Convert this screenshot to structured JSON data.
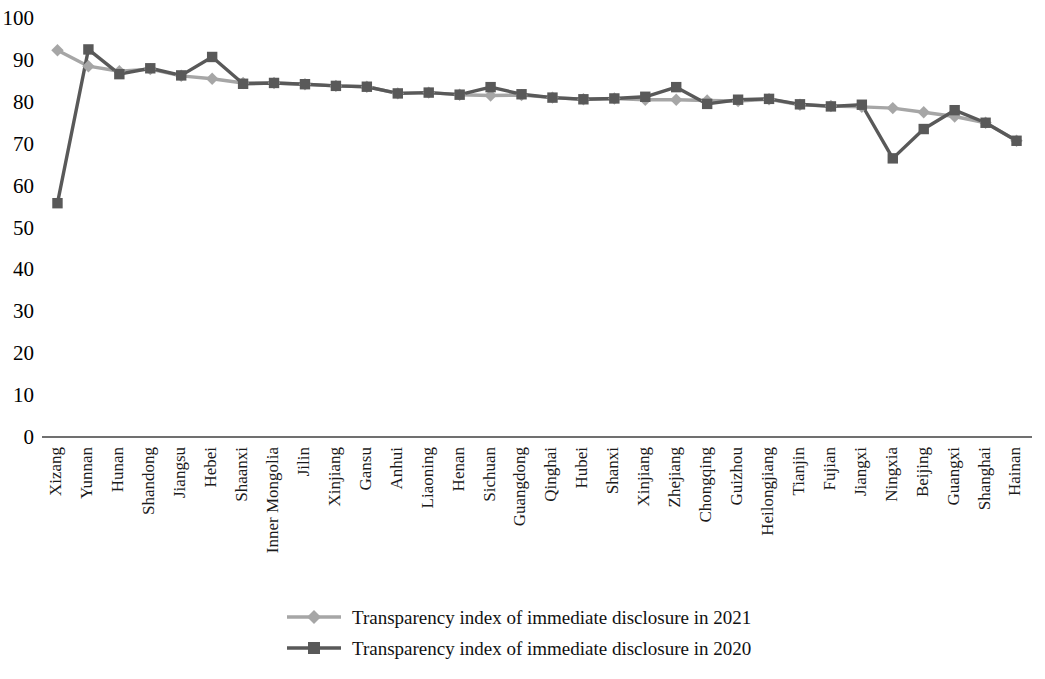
{
  "chart_data": {
    "type": "line",
    "title": "",
    "subtitle": "",
    "xlabel": "",
    "ylabel": "",
    "ylim": [
      0,
      100
    ],
    "ytick_values": [
      0,
      10,
      20,
      30,
      40,
      50,
      60,
      70,
      80,
      90,
      100
    ],
    "ytick_labels": [
      "0",
      "10",
      "20",
      "30",
      "40",
      "50",
      "60",
      "70",
      "80",
      "90",
      "100"
    ],
    "grid": false,
    "legend_position": "bottom",
    "categories": [
      "Xizang",
      "Yunnan",
      "Hunan",
      "Shandong",
      "Jiangsu",
      "Hebei",
      "Shaanxi",
      "Inner Mongolia",
      "Jilin",
      "Xinjiang",
      "Gansu",
      "Anhui",
      "Liaoning",
      "Henan",
      "Sichuan",
      "Guangdong",
      "Qinghai",
      "Hubei",
      "Shanxi",
      "Xinjiang",
      "Zhejiang",
      "Chongqing",
      "Guizhou",
      "Heilongjiang",
      "Tianjin",
      "Fujian",
      "Jiangxi",
      "Ningxia",
      "Beijing",
      "Guangxi",
      "Shanghai",
      "Hainan"
    ],
    "series": [
      {
        "name": "Transparency index of immediate disclosure in 2021",
        "color": "#a6a6a6",
        "marker": "diamond",
        "values": [
          92.3,
          88.5,
          87.3,
          87.8,
          86.2,
          85.5,
          84.5,
          84.5,
          84.2,
          83.8,
          83.6,
          82.0,
          82.2,
          81.7,
          81.5,
          81.6,
          81.0,
          80.6,
          80.8,
          80.5,
          80.5,
          80.3,
          80.2,
          80.6,
          79.3,
          79.0,
          78.8,
          78.5,
          77.5,
          76.5,
          75.0,
          70.7
        ]
      },
      {
        "name": "Transparency index of immediate disclosure in 2020",
        "color": "#595959",
        "marker": "square",
        "values": [
          55.8,
          92.5,
          86.6,
          88.0,
          86.3,
          90.7,
          84.3,
          84.5,
          84.2,
          83.8,
          83.6,
          82.0,
          82.2,
          81.7,
          83.5,
          81.8,
          81.0,
          80.6,
          80.8,
          81.2,
          83.5,
          79.5,
          80.5,
          80.7,
          79.4,
          78.9,
          79.3,
          66.5,
          73.5,
          78.0,
          75.0,
          70.7
        ]
      }
    ]
  },
  "legend": {
    "items": [
      {
        "label": "Transparency index of immediate disclosure in 2021",
        "color": "#a6a6a6",
        "marker": "diamond"
      },
      {
        "label": "Transparency index of immediate disclosure in 2020",
        "color": "#595959",
        "marker": "square"
      }
    ]
  },
  "axes": {
    "x_axis_color": "#404040",
    "y_min": 0,
    "y_max": 100
  }
}
